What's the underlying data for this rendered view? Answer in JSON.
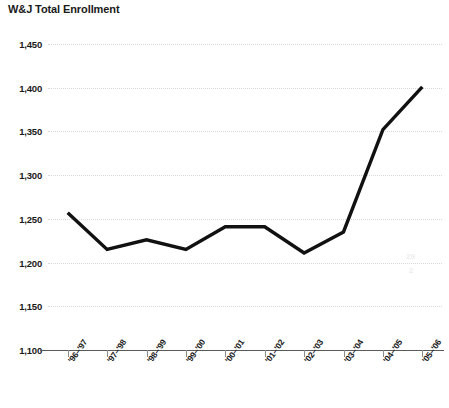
{
  "chart_data": {
    "type": "line",
    "title": "W&J Total Enrollment",
    "xlabel": "",
    "ylabel": "",
    "categories": [
      "'96–'97",
      "'97–'98",
      "'98–'99",
      "'99–'00",
      "'00–'01",
      "'01–'02",
      "'02–'03",
      "'03–'04",
      "'04–'05",
      "'05–'06"
    ],
    "values": [
      1257,
      1215,
      1226,
      1215,
      1241,
      1241,
      1211,
      1235,
      1352,
      1401
    ],
    "ylim": [
      1100,
      1450
    ],
    "yticks": [
      1100,
      1150,
      1200,
      1250,
      1300,
      1350,
      1400,
      1450
    ],
    "ytick_labels": [
      "1,100",
      "1,150",
      "1,200",
      "1,250",
      "1,300",
      "1,350",
      "1,400",
      "1,450"
    ],
    "grid": true,
    "legend": false,
    "series_color": "#111111",
    "grid_color": "#d8d8d8",
    "axis_color": "#5a5a5a"
  },
  "artifacts": {
    "smudge_top": "29",
    "smudge_bottom": "2"
  }
}
